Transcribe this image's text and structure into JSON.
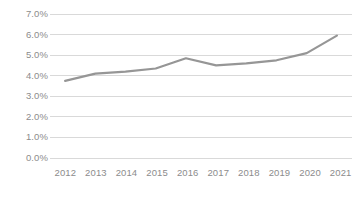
{
  "chart_data": {
    "type": "line",
    "title": "",
    "subtitle": "",
    "xlabel": "",
    "ylabel": "",
    "categories": [
      "2012",
      "2013",
      "2014",
      "2015",
      "2016",
      "2017",
      "2018",
      "2019",
      "2020",
      "2021"
    ],
    "values": [
      3.75,
      4.1,
      4.2,
      4.35,
      4.85,
      4.5,
      4.6,
      4.75,
      5.1,
      5.95
    ],
    "series": [
      {
        "name": "",
        "values": [
          3.75,
          4.1,
          4.2,
          4.35,
          4.85,
          4.5,
          4.6,
          4.75,
          5.1,
          5.95
        ]
      }
    ],
    "ylim": [
      0.0,
      7.0
    ],
    "ytick_values": [
      7.0,
      6.0,
      5.0,
      4.0,
      3.0,
      2.0,
      1.0,
      0.0
    ],
    "ytick_labels": [
      "7.0%",
      "6.0%",
      "5.0%",
      "4.0%",
      "3.0%",
      "2.0%",
      "1.0%",
      "0.0%"
    ],
    "grid": true,
    "grid_axis": "y",
    "legend": false,
    "legend_position": "none",
    "value_suffix": "%",
    "annotations": []
  },
  "style": {
    "line_color": "#969696",
    "grid_color": "#d9d9d9",
    "tick_label_color": "#8c8c8c",
    "background_color": "#ffffff",
    "line_width": 2.2
  }
}
